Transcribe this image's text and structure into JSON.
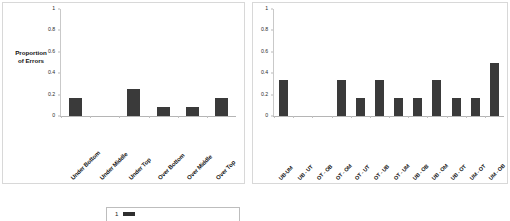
{
  "figure": {
    "background_color": "#ffffff",
    "bar_color": "#3a3a3a",
    "axis_color": "#c0c0c0"
  },
  "y_axis_title_line1": "Proportion",
  "y_axis_title_line2": "of Errors",
  "legend": {
    "label": "1",
    "swatch_color": "#2f2f2f"
  },
  "chart_data": [
    {
      "type": "bar",
      "title": "",
      "xlabel": "",
      "ylabel": "Proportion of Errors",
      "ylim": [
        0,
        1
      ],
      "yticks": [
        "0",
        "0.2",
        "0.4",
        "0.6",
        "0.8",
        "1"
      ],
      "ytick_values": [
        0,
        0.2,
        0.4,
        0.6,
        0.8,
        1
      ],
      "grid": false,
      "legend_position": "none",
      "categories": [
        "Under Bottom",
        "Under Middle",
        "Under Top",
        "Over Bottom",
        "Over Middle",
        "Over Top"
      ],
      "values": [
        0.167,
        0.0,
        0.25,
        0.083,
        0.083,
        0.167
      ]
    },
    {
      "type": "bar",
      "title": "",
      "xlabel": "",
      "ylabel": "",
      "ylim": [
        0,
        1
      ],
      "yticks": [
        "0",
        "0.2",
        "0.4",
        "0.6",
        "0.8",
        "1"
      ],
      "ytick_values": [
        0,
        0.2,
        0.4,
        0.6,
        0.8,
        1
      ],
      "grid": false,
      "legend_position": "none",
      "categories": [
        "UB-UM",
        "UB - UT",
        "OT - OB",
        "OT - OM",
        "OT - UT",
        "OT - UB",
        "OT - UM",
        "UB - OB",
        "UB - OM",
        "UB - OT",
        "UM - OT",
        "UM - OB"
      ],
      "values": [
        0.333,
        0.0,
        0.0,
        0.333,
        0.167,
        0.333,
        0.167,
        0.167,
        0.333,
        0.167,
        0.167,
        0.5
      ]
    }
  ]
}
